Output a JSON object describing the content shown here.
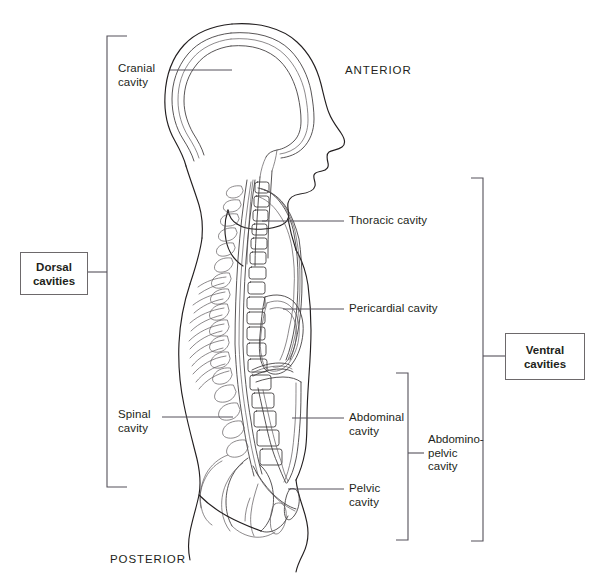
{
  "figure": {
    "background_color": "#ffffff",
    "line_color": "#231f20",
    "leader_color": "#54505a"
  },
  "orientation_labels": [
    {
      "id": "anterior",
      "text": "ANTERIOR",
      "x": 345,
      "y": 71
    },
    {
      "id": "posterior",
      "text": "POSTERIOR",
      "x": 110,
      "y": 560
    }
  ],
  "callouts": [
    {
      "id": "cranial-cavity",
      "text": "Cranial\ncavity",
      "x": 118,
      "y": 62,
      "leader": {
        "x1": 170,
        "y1": 70,
        "x2": 232,
        "y2": 70
      }
    },
    {
      "id": "thoracic-cavity",
      "text": "Thoracic cavity",
      "x": 349,
      "y": 214,
      "leader": {
        "x1": 262,
        "y1": 221,
        "x2": 344,
        "y2": 221
      }
    },
    {
      "id": "pericardial-cavity",
      "text": "Pericardial cavity",
      "x": 349,
      "y": 302,
      "leader": {
        "x1": 283,
        "y1": 309,
        "x2": 344,
        "y2": 309
      }
    },
    {
      "id": "spinal-cavity",
      "text": "Spinal\ncavity",
      "x": 118,
      "y": 408,
      "leader": {
        "x1": 162,
        "y1": 417,
        "x2": 233,
        "y2": 417
      }
    },
    {
      "id": "abdominal-cavity",
      "text": "Abdominal\ncavity",
      "x": 349,
      "y": 411,
      "leader": {
        "x1": 292,
        "y1": 418,
        "x2": 344,
        "y2": 418
      }
    },
    {
      "id": "pelvic-cavity",
      "text": "Pelvic\ncavity",
      "x": 349,
      "y": 482,
      "leader": {
        "x1": 288,
        "y1": 489,
        "x2": 344,
        "y2": 489
      }
    }
  ],
  "group_boxes": [
    {
      "id": "dorsal-cavities",
      "text": "Dorsal\ncavities",
      "x": 20,
      "y": 252,
      "width": 66,
      "height": 41
    },
    {
      "id": "ventral-cavities",
      "text": "Ventral\ncavities",
      "x": 505,
      "y": 333,
      "width": 78,
      "height": 45
    }
  ],
  "brackets": [
    {
      "id": "dorsal-bracket",
      "side": "left",
      "top": 36,
      "bottom": 487,
      "spine_x": 107,
      "arm_x": 127,
      "stem_y": 272,
      "stem_to_x": 86
    },
    {
      "id": "ventral-bracket",
      "side": "right",
      "top": 178,
      "bottom": 541,
      "spine_x": 483,
      "arm_x": 471,
      "stem_y": 356,
      "stem_to_x": 505
    },
    {
      "id": "abdominopelvic-bracket",
      "side": "right",
      "top": 373,
      "bottom": 540,
      "spine_x": 408,
      "arm_x": 396,
      "stem_y": 453,
      "stem_to_x": 424
    }
  ],
  "bracket_labels": [
    {
      "id": "abdominopelvic-cavity",
      "text": "Abdomino-\npelvic\ncavity",
      "x": 428,
      "y": 433
    }
  ],
  "cavity_list": [
    "Cranial cavity",
    "Spinal cavity",
    "Thoracic cavity",
    "Pericardial cavity",
    "Abdominal cavity",
    "Pelvic cavity",
    "Abdomino-pelvic cavity"
  ]
}
